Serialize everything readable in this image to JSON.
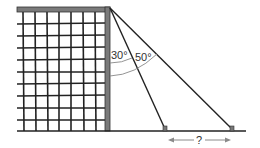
{
  "diagram": {
    "labels": {
      "angle_inner": "30°",
      "angle_outer": "50°",
      "unknown_distance": "?"
    },
    "colors": {
      "bar": "#7a7a7a",
      "lines": "#222222",
      "arc": "#888888",
      "arrow": "#8a8a8a"
    },
    "elements": {
      "net_grid": {
        "columns": 8,
        "rows": 9
      },
      "wires": [
        {
          "name": "inner-wire",
          "angle_from_post_deg": 30
        },
        {
          "name": "outer-wire",
          "angle_from_post_deg": 50
        }
      ]
    }
  }
}
